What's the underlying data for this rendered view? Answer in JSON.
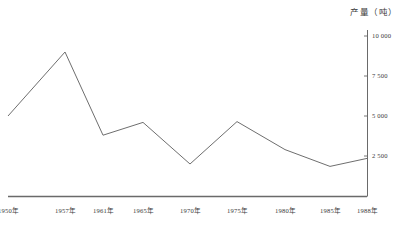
{
  "chart_data": {
    "type": "line",
    "title": "产量（吨）",
    "xlabel": "",
    "ylabel": "产量（吨）",
    "grid": false,
    "legend": null,
    "ylim": [
      0,
      10000
    ],
    "ytick_labels": [
      "10 000",
      "7 500",
      "5 000",
      "2 500"
    ],
    "ytick_values": [
      10000,
      7500,
      5000,
      2500
    ],
    "categories": [
      "1950年",
      "1957年",
      "1961年",
      "1965年",
      "1970年",
      "1975年",
      "1980年",
      "1985年",
      "1988年"
    ],
    "x_values": [
      1950,
      1957,
      1961,
      1965,
      1970,
      1975,
      1980,
      1985,
      1988
    ],
    "values": [
      5000,
      9000,
      3800,
      4600,
      2000,
      4650,
      2900,
      1850,
      2350
    ],
    "series": [
      {
        "name": "产量",
        "values": [
          5000,
          9000,
          3800,
          4600,
          2000,
          4650,
          2900,
          1850,
          2350
        ]
      }
    ],
    "line_color": "#6e6e6e",
    "axis_color": "#5a5a5a"
  },
  "axis": {
    "title": "产量（吨）",
    "y_ticks": [
      {
        "label": "10 000",
        "value": 10000
      },
      {
        "label": "7 500",
        "value": 7500
      },
      {
        "label": "5 000",
        "value": 5000
      },
      {
        "label": "2 500",
        "value": 2500
      }
    ],
    "x_ticks": [
      {
        "label": "1950年"
      },
      {
        "label": "1957年"
      },
      {
        "label": "1961年"
      },
      {
        "label": "1965年"
      },
      {
        "label": "1970年"
      },
      {
        "label": "1975年"
      },
      {
        "label": "1980年"
      },
      {
        "label": "1985年"
      },
      {
        "label": "1988年"
      }
    ]
  }
}
